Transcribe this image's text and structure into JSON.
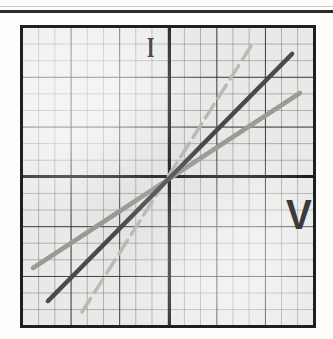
{
  "page": {
    "background_color": "#fdfdfc",
    "top_rule_color": "#2b2b2b"
  },
  "plot": {
    "frame_color": "#1f1f1f",
    "paper_color": "#e9e9e7",
    "grid_minor_color": "#5a5a5a",
    "grid_major_color": "#282828",
    "axis_color": "#151515",
    "minor_cells_x": 18,
    "minor_cells_y": 18,
    "minor_per_major": 3,
    "axis_labels": {
      "y_label": "I",
      "x_label": "V"
    }
  },
  "chart_data": {
    "type": "line",
    "title": "",
    "subtitle": "",
    "xlabel": "V",
    "ylabel": "I",
    "grid": true,
    "grid_style": "graph-paper",
    "legend": "none",
    "origin_at": {
      "x": 0,
      "y": 0
    },
    "xlim": [
      -9,
      9
    ],
    "ylim": [
      -9,
      9
    ],
    "x_tick_labels": [],
    "y_tick_labels": [],
    "annotations": [
      {
        "text": "I",
        "x": 7.6,
        "y": 8.0,
        "note": "current axis label, upper-left quadrant near y-axis"
      },
      {
        "text": "V",
        "x": 7.2,
        "y": -1.4,
        "note": "voltage axis label, lower-right quadrant"
      }
    ],
    "series": [
      {
        "name": "line-steep-dashed",
        "style": "dashed",
        "color": "#b9b9b6",
        "width": 3,
        "slope": 2.05,
        "intercept": 0,
        "x": [
          -5.2,
          5.2
        ],
        "y": [
          -10.7,
          10.7
        ],
        "endpoints_px": [
          [
            82,
            312
          ],
          [
            253,
            43
          ]
        ]
      },
      {
        "name": "line-middle-solid-dark",
        "style": "solid",
        "color": "#4a4a4a",
        "width": 4,
        "slope": 1.25,
        "intercept": 0,
        "x": [
          -7.4,
          7.6
        ],
        "y": [
          -9.2,
          9.5
        ],
        "endpoints_px": [
          [
            48,
            301
          ],
          [
            292,
            54
          ]
        ]
      },
      {
        "name": "line-shallow-solid-gray",
        "style": "solid",
        "color": "#9a9a97",
        "width": 4,
        "slope": 0.76,
        "intercept": 0,
        "x": [
          -8.4,
          8.3
        ],
        "y": [
          -6.4,
          6.3
        ],
        "endpoints_px": [
          [
            33,
            268
          ],
          [
            300,
            93
          ]
        ]
      }
    ]
  }
}
